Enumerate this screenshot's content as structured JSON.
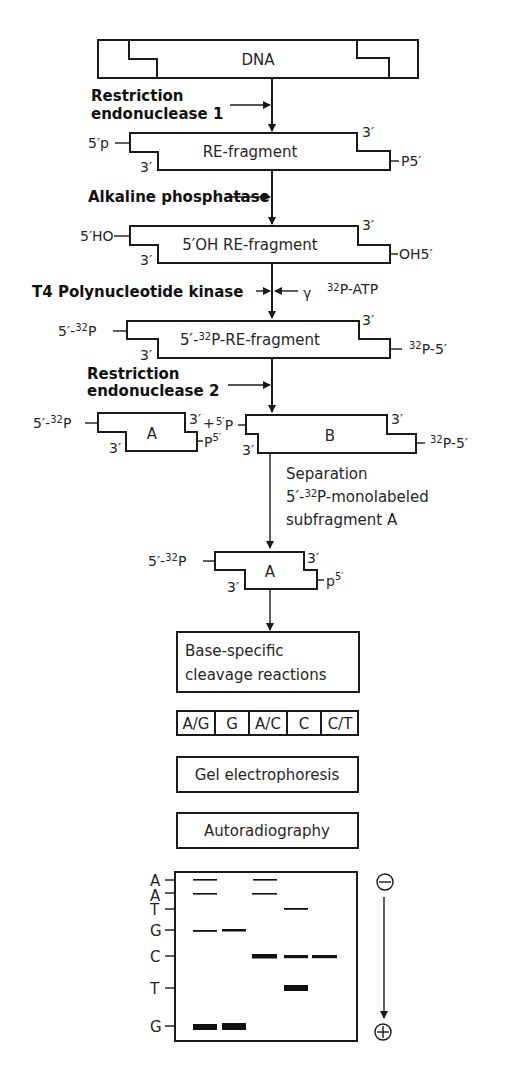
{
  "figure": {
    "dna": {
      "label": "DNA"
    },
    "step1": {
      "line1": "Restriction",
      "line2": "endonuclease 1"
    },
    "re_fragment": {
      "label": "RE-fragment",
      "left_end": "5′p",
      "left_3": "3′",
      "right_3": "3′",
      "right_end": "P5′"
    },
    "step2": {
      "label": "Alkaline phosphatase"
    },
    "oh_fragment": {
      "label": "5′OH RE-fragment",
      "left_end": "5′HO",
      "left_3": "3′",
      "right_3": "3′",
      "right_end": "OH5′"
    },
    "step3": {
      "label": "T4 Polynucleotide kinase",
      "reagent_gamma": "γ",
      "reagent_sup": "32",
      "reagent_rest": "P-ATP"
    },
    "labeled_fragment": {
      "label_pre": "5′-",
      "label_sup": "32",
      "label_post": "P-RE-fragment",
      "left_pre": "5′-",
      "left_sup": "32",
      "left_post": "P",
      "left_3": "3′",
      "right_3": "3′",
      "right_sup": "32",
      "right_post": "P-5′"
    },
    "step4": {
      "line1": "Restriction",
      "line2": "endonuclease 2"
    },
    "subfragment_a": {
      "label": "A",
      "left_pre": "5′-",
      "left_sup": "32",
      "left_post": "P",
      "left_3": "3′",
      "right_3": "3′",
      "plus": "+",
      "right_end": "P",
      "right_end_sup": "5′"
    },
    "subfragment_b": {
      "label": "B",
      "left_sup": "5′",
      "left_post": "P",
      "left_3": "3′",
      "right_3": "3′",
      "right_sup": "32",
      "right_post": "P-5′"
    },
    "step5": {
      "line1": "Separation",
      "line2_pre": "5′-",
      "line2_sup": "32",
      "line2_post": "P-monolabeled",
      "line3": "subfragment A"
    },
    "isolated_a": {
      "label": "A",
      "left_pre": "5′-",
      "left_sup": "32",
      "left_post": "P",
      "left_3": "3′",
      "right_3": "3′",
      "right_end": "p",
      "right_end_sup": "5′"
    },
    "cleavage_box": {
      "line1": "Base-specific",
      "line2": "cleavage reactions"
    },
    "lanes": [
      "A/G",
      "G",
      "A/C",
      "C",
      "C/T"
    ],
    "gel_box": {
      "label": "Gel electrophoresis"
    },
    "autorad_box": {
      "label": "Autoradiography"
    },
    "gel": {
      "sequence_labels": [
        "A",
        "A",
        "T",
        "G",
        "C",
        "T",
        "G"
      ],
      "cathode": "⊖",
      "anode": "⊕",
      "bands": [
        {
          "row": 0,
          "lanes": [
            0,
            2
          ],
          "weight": "thin"
        },
        {
          "row": 1,
          "lanes": [
            0,
            2
          ],
          "weight": "thin"
        },
        {
          "row": 2,
          "lanes": [
            3
          ],
          "weight": "thin"
        },
        {
          "row": 3,
          "lanes": [
            0,
            1
          ],
          "weight": "thin"
        },
        {
          "row": 4,
          "lanes": [
            2,
            3,
            4
          ],
          "weight": "thick"
        },
        {
          "row": 5,
          "lanes": [
            3
          ],
          "weight": "heavy"
        },
        {
          "row": 6,
          "lanes": [
            0,
            1
          ],
          "weight": "heavy"
        }
      ]
    }
  }
}
